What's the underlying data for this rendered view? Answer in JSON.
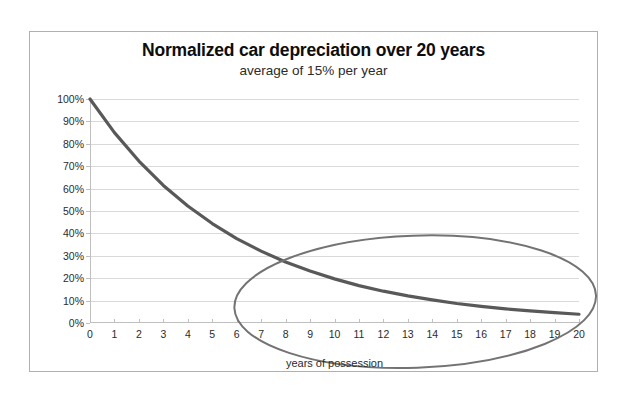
{
  "chart_data": {
    "type": "line",
    "title": "Normalized car depreciation over 20 years",
    "subtitle": "average of 15% per year",
    "xlabel": "years of possession",
    "ylabel": "",
    "xlim": [
      0,
      20
    ],
    "ylim": [
      0,
      100
    ],
    "grid": true,
    "legend": "none",
    "x": [
      0,
      1,
      2,
      3,
      4,
      5,
      6,
      7,
      8,
      9,
      10,
      11,
      12,
      13,
      14,
      15,
      16,
      17,
      18,
      19,
      20
    ],
    "x_tick_labels": [
      "0",
      "1",
      "2",
      "3",
      "4",
      "5",
      "6",
      "7",
      "8",
      "9",
      "10",
      "11",
      "12",
      "13",
      "14",
      "15",
      "16",
      "17",
      "18",
      "19",
      "20"
    ],
    "y_tick_values": [
      0,
      10,
      20,
      30,
      40,
      50,
      60,
      70,
      80,
      90,
      100
    ],
    "y_tick_labels": [
      "0%",
      "10%",
      "20%",
      "30%",
      "40%",
      "50%",
      "60%",
      "70%",
      "80%",
      "90%",
      "100%"
    ],
    "series": [
      {
        "name": "Normalized value",
        "color": "#595959",
        "line_width": 3.2,
        "values": [
          100,
          85,
          72.3,
          61.4,
          52.2,
          44.4,
          37.7,
          32.1,
          27.2,
          23.2,
          19.7,
          16.7,
          14.2,
          12.1,
          10.3,
          8.7,
          7.4,
          6.3,
          5.4,
          4.6,
          3.9
        ]
      }
    ],
    "annotations": [
      {
        "kind": "ellipse",
        "label": "highlight-ellipse",
        "color": "#737373",
        "line_width": 2,
        "center_x_years": 13.3,
        "center_y_percent": 9.5,
        "radius_x_years": 7.4,
        "radius_y_percent": 29.5,
        "rotation_deg": -2
      }
    ]
  },
  "axis": {
    "x_title": "years of possession"
  },
  "colors": {
    "curve": "#595959",
    "annotation": "#737373",
    "gridline": "#d9d9d9",
    "axis": "#bfbfbf",
    "frame": "#b0b0b0",
    "text": "#2b2b2b",
    "title_text": "#0d0d0d",
    "background": "#ffffff"
  }
}
